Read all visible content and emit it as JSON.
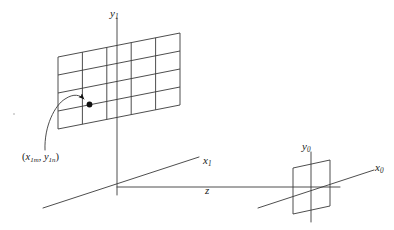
{
  "figure": {
    "kind": "coordinate-system-diagram",
    "background_color": "#ffffff",
    "stroke_color": "#3a3a3a",
    "text_color": "#1a1a1a",
    "width": 394,
    "height": 230
  },
  "labels": {
    "y1": {
      "base": "y",
      "sub": "1",
      "text": "y1"
    },
    "x1": {
      "base": "x",
      "sub": "1",
      "text": "x1"
    },
    "z": {
      "base": "z",
      "sub": "",
      "text": "z"
    },
    "y0": {
      "base": "y",
      "sub": "0",
      "text": "y0"
    },
    "x0": {
      "base": "x",
      "sub": "0",
      "text": "x0"
    },
    "sample_point": {
      "open": "(",
      "x_base": "x",
      "x_sub": "1m",
      "comma": ", ",
      "y_base": "y",
      "y_sub": "1n",
      "close": ")",
      "text": "(x1m, y1n)"
    }
  },
  "input_plane": {
    "name": "sampled-input-plane",
    "columns": 5,
    "rows": 4,
    "corners": {
      "top_left": [
        58,
        57
      ],
      "top_right": [
        180,
        33
      ],
      "bottom_right": [
        180,
        105
      ],
      "bottom_left": [
        58,
        129
      ]
    }
  },
  "output_plane": {
    "name": "output-aperture-plane",
    "corners": {
      "top_left": [
        293,
        168
      ],
      "top_right": [
        330,
        160
      ],
      "bottom_right": [
        330,
        206
      ],
      "bottom_left": [
        293,
        214
      ]
    }
  },
  "axes": {
    "origin_1": [
      117,
      187
    ],
    "origin_0": [
      311,
      187
    ],
    "y1_axis": {
      "from": [
        117,
        18
      ],
      "to": [
        117,
        195
      ]
    },
    "y0_axis": {
      "from": [
        311,
        152
      ],
      "to": [
        311,
        222
      ]
    },
    "x1_axis": {
      "from": [
        43,
        208
      ],
      "to": [
        199,
        157
      ]
    },
    "x0_axis": {
      "from": [
        258,
        208
      ],
      "to": [
        374,
        170
      ]
    },
    "z_axis": {
      "from": [
        117,
        187
      ],
      "to": [
        340,
        187
      ]
    }
  },
  "callout": {
    "name": "sample-point-callout",
    "dot": [
      89,
      104
    ],
    "arrow_tip": [
      86,
      100
    ],
    "curve_start": [
      45,
      150
    ]
  }
}
